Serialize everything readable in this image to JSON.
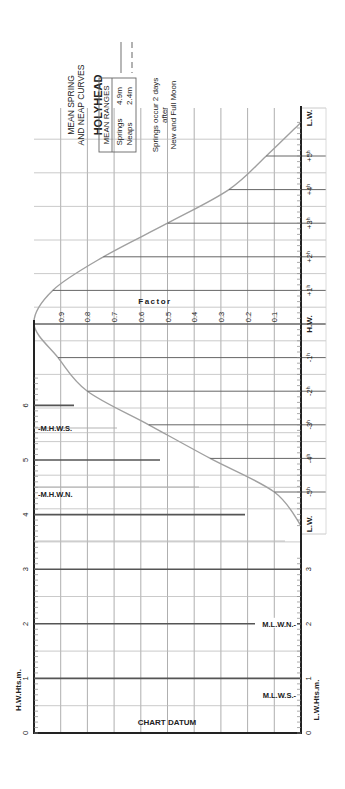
{
  "title": "HOLYHEAD",
  "subtitle_line1": "MEAN SPRING",
  "subtitle_line2": "AND NEAP CURVES",
  "legend": {
    "header": "MEAN RANGES",
    "springs_label": "Springs",
    "springs_value": "4.9m",
    "neaps_label": "Neaps",
    "neaps_value": "2.4m",
    "springs_line_style": "solid",
    "neaps_line_style": "dashed"
  },
  "note_line1": "Springs occur 2 days",
  "note_line2": "after",
  "note_line3": "New and Full Moon",
  "factor_label": "Factor",
  "factor_ticks": [
    "0.9",
    "0.8",
    "0.7",
    "0.6",
    "0.5",
    "0.4",
    "0.3",
    "0.2",
    "0.1"
  ],
  "time_axis": {
    "top_end": "L.W.",
    "after_hw": [
      "+5",
      "+4",
      "+3",
      "+2",
      "+1"
    ],
    "hw": "H.W.",
    "before_hw": [
      "-1",
      "-2",
      "-3",
      "-4",
      "-5"
    ],
    "bottom_end": "L.W."
  },
  "left_axis": {
    "label": "H.W.Hts.m.",
    "ticks": [
      "0",
      "1",
      "2",
      "3",
      "4",
      "5",
      "6"
    ]
  },
  "right_axis": {
    "label": "L.W.Hts.m.",
    "ticks": [
      "0",
      "1",
      "2",
      "3"
    ]
  },
  "markers": {
    "mhws": "M.H.W.S.",
    "mhwn": "M.H.W.N.",
    "mlwn": "M.L.W.N.",
    "mlws": "M.L.W.S."
  },
  "chart_datum": "CHART DATUM",
  "colors": {
    "ink": "#222222",
    "grid": "#9a9a9a",
    "curve": "#a0a0a0",
    "heavy": "#555555"
  },
  "chart_data": {
    "type": "line",
    "xlabel": "Hours relative to H.W.",
    "ylabel": "Factor",
    "ylim": [
      0,
      1
    ],
    "x": [
      -6,
      -5,
      -4,
      -3,
      -2,
      -1,
      0,
      1,
      2,
      3,
      4,
      5,
      6
    ],
    "series": [
      {
        "name": "Springs (4.9m)",
        "values": [
          0.0,
          0.1,
          0.34,
          0.57,
          0.8,
          0.91,
          1.0,
          0.93,
          0.74,
          0.5,
          0.27,
          0.13,
          0.0
        ]
      }
    ],
    "height_scale": {
      "hw_heights_m": [
        0,
        6
      ],
      "lw_heights_m": [
        0,
        3
      ]
    },
    "levels_m": {
      "MHWS": 5.6,
      "MHWN": 4.4,
      "MLWN": 2.0,
      "MLWS": 0.7
    }
  }
}
